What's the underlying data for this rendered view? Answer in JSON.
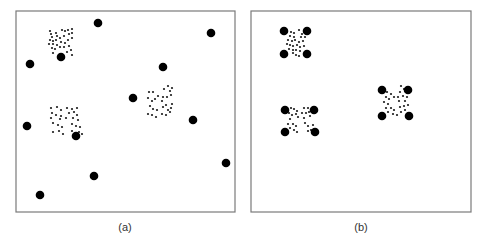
{
  "figure": {
    "width": 483,
    "height": 242,
    "colors": {
      "frame": "#7a7a7a",
      "big_dot": "#000000",
      "small_dot": "#1a1a1a",
      "caption": "#333333"
    },
    "big_dot_radius": 4.3,
    "small_dot_radius": 1.1,
    "panels": [
      {
        "id": "a",
        "caption": "(a)",
        "frame": {
          "x": 16,
          "y": 11,
          "w": 219,
          "h": 201
        },
        "caption_pos": {
          "x": 125,
          "y": 231
        },
        "big_dots": [
          [
            98,
            23
          ],
          [
            211,
            33
          ],
          [
            61,
            57
          ],
          [
            30,
            64
          ],
          [
            163,
            67
          ],
          [
            133,
            98
          ],
          [
            193,
            120
          ],
          [
            27,
            126
          ],
          [
            76,
            136
          ],
          [
            226,
            163
          ],
          [
            94,
            176
          ],
          [
            40,
            195
          ]
        ],
        "clusters": [
          {
            "name": "cluster-top-left",
            "points": [
              [
                50,
                31
              ],
              [
                51,
                34
              ],
              [
                52,
                37
              ],
              [
                56,
                33
              ],
              [
                57,
                36
              ],
              [
                62,
                30
              ],
              [
                65,
                31
              ],
              [
                68,
                30
              ],
              [
                72,
                29
              ],
              [
                50,
                40
              ],
              [
                53,
                41
              ],
              [
                56,
                40
              ],
              [
                60,
                38
              ],
              [
                64,
                36
              ],
              [
                69,
                34
              ],
              [
                72,
                33
              ],
              [
                72,
                38
              ],
              [
                49,
                44
              ],
              [
                53,
                44
              ],
              [
                57,
                45
              ],
              [
                61,
                42
              ],
              [
                65,
                43
              ],
              [
                68,
                40
              ],
              [
                52,
                48
              ],
              [
                55,
                49
              ],
              [
                60,
                47
              ],
              [
                64,
                47
              ],
              [
                69,
                46
              ],
              [
                71,
                50
              ],
              [
                53,
                53
              ],
              [
                67,
                52
              ],
              [
                72,
                55
              ]
            ]
          },
          {
            "name": "cluster-middle-left",
            "points": [
              [
                51,
                108
              ],
              [
                57,
                107
              ],
              [
                61,
                110
              ],
              [
                67,
                108
              ],
              [
                72,
                109
              ],
              [
                77,
                108
              ],
              [
                52,
                113
              ],
              [
                56,
                115
              ],
              [
                61,
                116
              ],
              [
                69,
                113
              ],
              [
                74,
                112
              ],
              [
                77,
                115
              ],
              [
                51,
                118
              ],
              [
                60,
                119
              ],
              [
                66,
                118
              ],
              [
                73,
                118
              ],
              [
                78,
                120
              ],
              [
                53,
                123
              ],
              [
                58,
                125
              ],
              [
                62,
                127
              ],
              [
                72,
                124
              ],
              [
                76,
                126
              ],
              [
                80,
                127
              ],
              [
                53,
                132
              ],
              [
                59,
                131
              ],
              [
                63,
                134
              ],
              [
                72,
                131
              ],
              [
                79,
                132
              ],
              [
                82,
                134
              ]
            ]
          },
          {
            "name": "cluster-center-right",
            "points": [
              [
                168,
                86
              ],
              [
                172,
                88
              ],
              [
                164,
                89
              ],
              [
                170,
                91
              ],
              [
                149,
                92
              ],
              [
                153,
                92
              ],
              [
                158,
                96
              ],
              [
                163,
                97
              ],
              [
                167,
                97
              ],
              [
                171,
                95
              ],
              [
                148,
                98
              ],
              [
                152,
                101
              ],
              [
                155,
                99
              ],
              [
                162,
                101
              ],
              [
                166,
                105
              ],
              [
                172,
                104
              ],
              [
                150,
                106
              ],
              [
                153,
                109
              ],
              [
                157,
                110
              ],
              [
                163,
                107
              ],
              [
                168,
                110
              ],
              [
                171,
                108
              ],
              [
                148,
                114
              ],
              [
                152,
                115
              ],
              [
                156,
                117
              ],
              [
                162,
                114
              ],
              [
                166,
                115
              ],
              [
                170,
                112
              ]
            ]
          }
        ]
      },
      {
        "id": "b",
        "caption": "(b)",
        "frame": {
          "x": 251,
          "y": 11,
          "w": 220,
          "h": 201
        },
        "caption_pos": {
          "x": 361,
          "y": 231
        },
        "big_dots": [
          [
            284,
            31
          ],
          [
            307,
            31
          ],
          [
            284,
            54
          ],
          [
            307,
            54
          ],
          [
            285,
            110
          ],
          [
            314,
            110
          ],
          [
            285,
            132
          ],
          [
            315,
            132
          ],
          [
            382,
            90
          ],
          [
            408,
            90
          ],
          [
            382,
            116
          ],
          [
            409,
            116
          ]
        ],
        "clusters": [
          {
            "name": "cluster-top-left",
            "points": [
              [
                291,
                32
              ],
              [
                294,
                33
              ],
              [
                299,
                30
              ],
              [
                302,
                34
              ],
              [
                290,
                36
              ],
              [
                294,
                37
              ],
              [
                301,
                37
              ],
              [
                305,
                37
              ],
              [
                288,
                40
              ],
              [
                292,
                41
              ],
              [
                295,
                40
              ],
              [
                299,
                42
              ],
              [
                303,
                41
              ],
              [
                287,
                44
              ],
              [
                290,
                45
              ],
              [
                293,
                46
              ],
              [
                297,
                45
              ],
              [
                300,
                47
              ],
              [
                304,
                46
              ],
              [
                289,
                49
              ],
              [
                293,
                50
              ],
              [
                296,
                50
              ],
              [
                300,
                51
              ],
              [
                296,
                55
              ],
              [
                299,
                56
              ],
              [
                293,
                53
              ]
            ]
          },
          {
            "name": "cluster-middle-left",
            "points": [
              [
                291,
                108
              ],
              [
                294,
                109
              ],
              [
                297,
                111
              ],
              [
                304,
                108
              ],
              [
                308,
                108
              ],
              [
                289,
                113
              ],
              [
                292,
                115
              ],
              [
                296,
                114
              ],
              [
                302,
                113
              ],
              [
                306,
                113
              ],
              [
                309,
                112
              ],
              [
                290,
                119
              ],
              [
                298,
                117
              ],
              [
                304,
                118
              ],
              [
                310,
                116
              ],
              [
                288,
                124
              ],
              [
                293,
                124
              ],
              [
                296,
                126
              ],
              [
                305,
                123
              ],
              [
                308,
                126
              ],
              [
                313,
                125
              ],
              [
                290,
                128
              ],
              [
                294,
                130
              ],
              [
                297,
                132
              ],
              [
                308,
                131
              ],
              [
                311,
                130
              ]
            ]
          },
          {
            "name": "cluster-center-right",
            "points": [
              [
                387,
                92
              ],
              [
                391,
                94
              ],
              [
                401,
                86
              ],
              [
                404,
                89
              ],
              [
                400,
                92
              ],
              [
                386,
                97
              ],
              [
                389,
                99
              ],
              [
                394,
                97
              ],
              [
                398,
                97
              ],
              [
                403,
                96
              ],
              [
                407,
                97
              ],
              [
                384,
                102
              ],
              [
                388,
                104
              ],
              [
                399,
                101
              ],
              [
                405,
                101
              ],
              [
                386,
                108
              ],
              [
                391,
                108
              ],
              [
                394,
                110
              ],
              [
                400,
                107
              ],
              [
                404,
                106
              ],
              [
                408,
                105
              ],
              [
                388,
                112
              ],
              [
                393,
                114
              ],
              [
                397,
                115
              ],
              [
                401,
                112
              ],
              [
                405,
                110
              ]
            ]
          }
        ]
      }
    ]
  }
}
